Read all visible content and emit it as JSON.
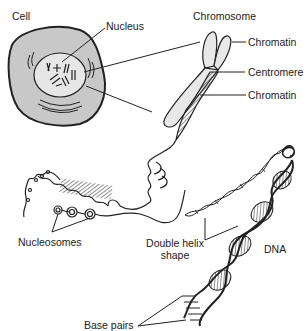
{
  "diagram": {
    "colors": {
      "ink": "#222222",
      "cell_fill": "#c8c8c8",
      "nucleus_fill": "#e6e6e6",
      "chromosome_fill": "#e8e8e8",
      "background": "#ffffff"
    },
    "labels": {
      "cell": "Cell",
      "nucleus": "Nucleus",
      "chromosome": "Chromosome",
      "chromatin_top": "Chromatin",
      "centromere": "Centromere",
      "chromatin_bottom": "Chromatin",
      "nucleosomes": "Nucleosomes",
      "double_helix_line1": "Double helix",
      "double_helix_line2": "shape",
      "dna": "DNA",
      "base_pairs": "Base pairs"
    }
  }
}
